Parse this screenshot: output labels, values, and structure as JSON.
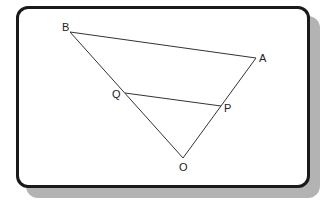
{
  "figure": {
    "points": {
      "B": {
        "label": "B",
        "x": 70,
        "y": 32,
        "lx": 62,
        "ly": 31
      },
      "A": {
        "label": "A",
        "x": 256,
        "y": 58,
        "lx": 259,
        "ly": 62
      },
      "Q": {
        "label": "Q",
        "x": 125,
        "y": 93,
        "lx": 112,
        "ly": 98
      },
      "P": {
        "label": "P",
        "x": 221,
        "y": 106,
        "lx": 224,
        "ly": 112
      },
      "O": {
        "label": "O",
        "x": 183,
        "y": 158,
        "lx": 179,
        "ly": 171
      }
    },
    "segments": [
      [
        "B",
        "A"
      ],
      [
        "B",
        "O"
      ],
      [
        "A",
        "O"
      ],
      [
        "Q",
        "P"
      ]
    ],
    "line_color": "#333333",
    "frame_color": "#1a1a1a",
    "shadow_color": "#b3b3b3"
  }
}
